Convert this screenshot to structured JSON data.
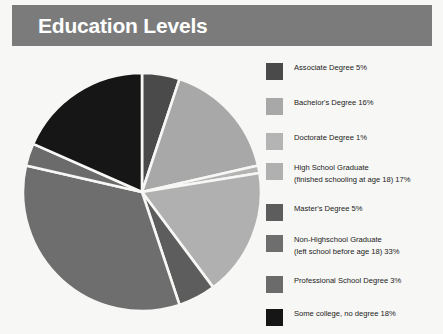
{
  "header": {
    "title": "Education Levels",
    "bar_color": "#7b7b7b",
    "title_color": "#ffffff"
  },
  "background_color": "#f7f7f5",
  "chart_data": {
    "type": "pie",
    "title": "Education Levels",
    "xlabel": "",
    "ylabel": "",
    "units": "percent",
    "start_angle_deg": 0,
    "direction": "clockwise",
    "slice_gap": "white separator",
    "legend_position": "right",
    "grid": false,
    "categories": [
      "Associate Degree",
      "Bachelor's Degree",
      "Doctorate Degree",
      "High School Graduate (finished schooling at age 18)",
      "Master's Degree",
      "Non-Highschool Graduate (left school before age 18)",
      "Professional School Degree",
      "Some college, no degree"
    ],
    "values": [
      5,
      16,
      1,
      17,
      5,
      33,
      3,
      18
    ],
    "colors": [
      "#4a4a4a",
      "#a8a8a8",
      "#b4b4b4",
      "#b0b0b0",
      "#5d5d5d",
      "#6e6e6e",
      "#6b6b6b",
      "#161616"
    ],
    "total": 98
  },
  "legend": {
    "items": [
      {
        "label_line1": "Associate Degree 5%",
        "label_line2": "",
        "value": 5,
        "color": "#4a4a4a",
        "top": 0
      },
      {
        "label_line1": "Bachelor's Degree 16%",
        "label_line2": "",
        "value": 16,
        "color": "#a8a8a8",
        "top": 35
      },
      {
        "label_line1": "Doctorate Degree 1%",
        "label_line2": "",
        "value": 1,
        "color": "#b4b4b4",
        "top": 70
      },
      {
        "label_line1": "High School Graduate",
        "label_line2": "(finished schooling at age 18) 17%",
        "value": 17,
        "color": "#b0b0b0",
        "top": 100
      },
      {
        "label_line1": "Master's Degree 5%",
        "label_line2": "",
        "value": 5,
        "color": "#5d5d5d",
        "top": 141
      },
      {
        "label_line1": "Non-Highschool Graduate",
        "label_line2": "(left school before age 18) 33%",
        "value": 33,
        "color": "#6e6e6e",
        "top": 172
      },
      {
        "label_line1": "Professional School Degree 3%",
        "label_line2": "",
        "value": 3,
        "color": "#6b6b6b",
        "top": 213
      },
      {
        "label_line1": "Some college, no degree 18%",
        "label_line2": "",
        "value": 18,
        "color": "#161616",
        "top": 246
      }
    ]
  }
}
